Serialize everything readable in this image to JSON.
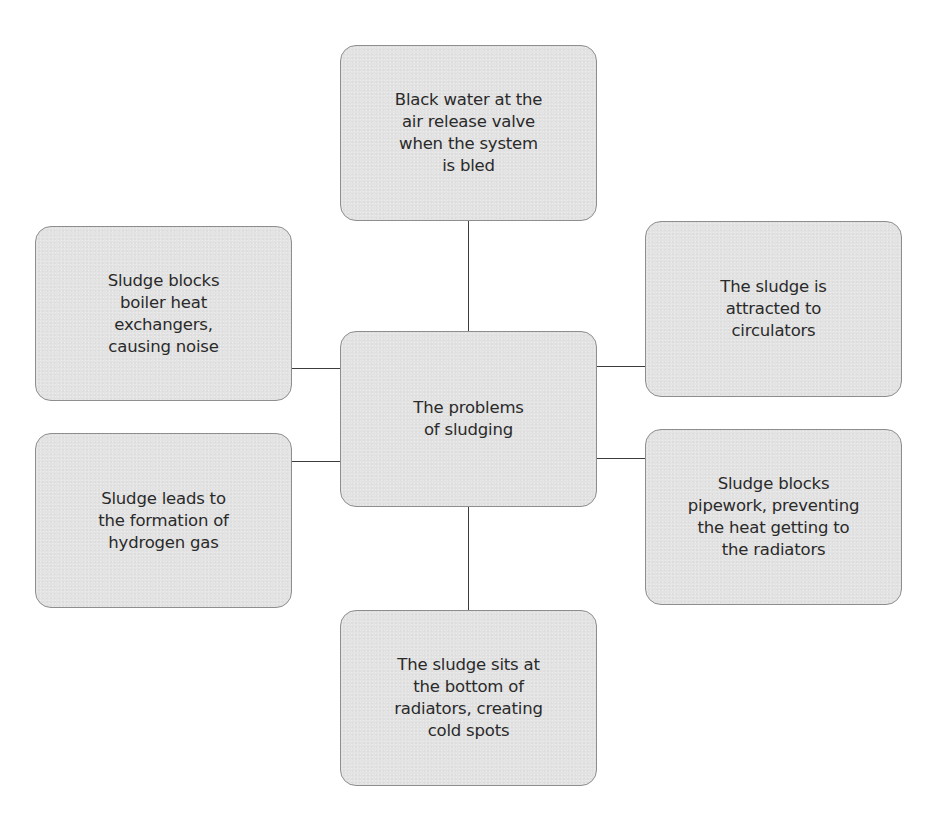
{
  "diagram": {
    "type": "spider-diagram",
    "center": {
      "label": "The problems\nof sludging"
    },
    "nodes": [
      {
        "id": "top",
        "position": "top",
        "label": "Black water at the\nair release valve\nwhen the system\nis bled"
      },
      {
        "id": "left-top",
        "position": "left-top",
        "label": "Sludge blocks\nboiler heat\nexchangers,\ncausing noise"
      },
      {
        "id": "right-top",
        "position": "right-top",
        "label": "The sludge is\nattracted to\ncirculators"
      },
      {
        "id": "left-bottom",
        "position": "left-bottom",
        "label": "Sludge leads to\nthe formation of\nhydrogen gas"
      },
      {
        "id": "right-bottom",
        "position": "right-bottom",
        "label": "Sludge blocks\npipework, preventing\nthe heat getting to\nthe radiators"
      },
      {
        "id": "bottom",
        "position": "bottom",
        "label": "The sludge sits at\nthe bottom of\nradiators, creating\ncold spots"
      }
    ],
    "colors": {
      "node_fill": "#e3e3e3",
      "node_border": "#8e8e8e",
      "connector": "#3c3c3c",
      "text": "#2a2a2a",
      "background": "#ffffff"
    }
  }
}
